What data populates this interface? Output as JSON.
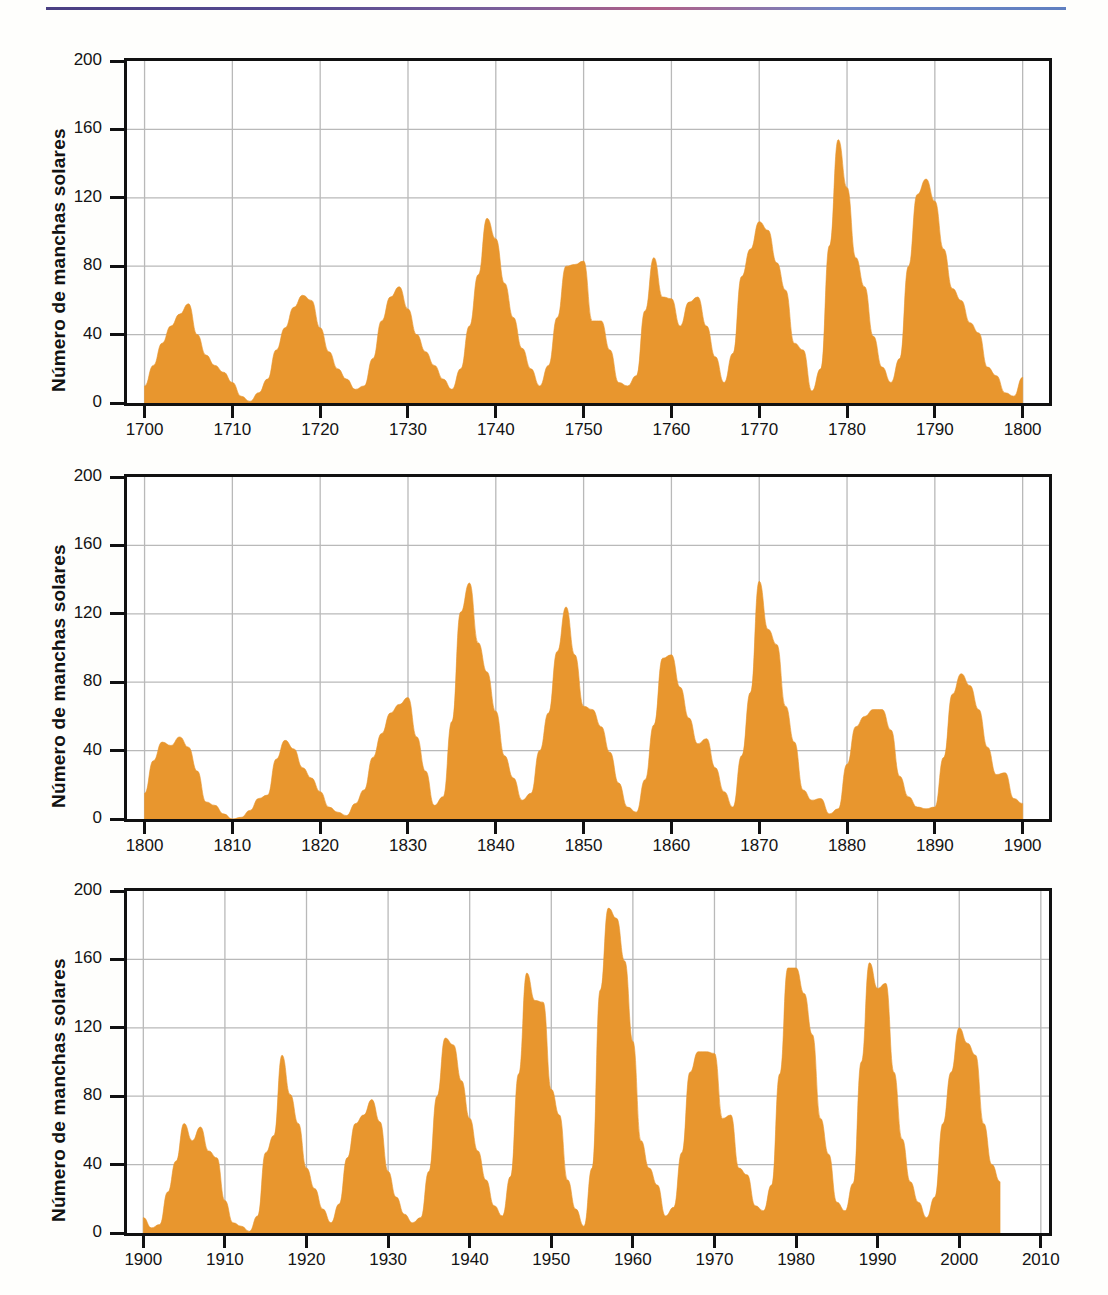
{
  "figure": {
    "ylabel": "Número de manchas solares",
    "series_color": "#e8962e",
    "grid_color": "#b9b9b9",
    "axis_color": "#111111",
    "top_rule_colors": [
      "#4a3f82",
      "#b05f86",
      "#5f7fc0"
    ]
  },
  "chart_data": [
    {
      "type": "area",
      "title": "",
      "xlabel": "",
      "ylabel": "Número de manchas solares",
      "xlim": [
        1698,
        1803
      ],
      "ylim": [
        0,
        200
      ],
      "xticks": [
        1700,
        1710,
        1720,
        1730,
        1740,
        1750,
        1760,
        1770,
        1780,
        1790,
        1800
      ],
      "yticks": [
        0,
        40,
        80,
        120,
        160,
        200
      ],
      "xtick_labels": [
        "1700",
        "1710",
        "1720",
        "1730",
        "1740",
        "1750",
        "1760",
        "1770",
        "1780",
        "1790",
        "1800"
      ],
      "ytick_labels": [
        "0",
        "40",
        "80",
        "120",
        "160",
        "200"
      ],
      "grid": true,
      "legend": "none",
      "series": [
        {
          "name": "Número de manchas solares",
          "x": [
            1700,
            1701,
            1702,
            1703,
            1704,
            1705,
            1706,
            1707,
            1708,
            1709,
            1710,
            1711,
            1712,
            1713,
            1714,
            1715,
            1716,
            1717,
            1718,
            1719,
            1720,
            1721,
            1722,
            1723,
            1724,
            1725,
            1726,
            1727,
            1728,
            1729,
            1730,
            1731,
            1732,
            1733,
            1734,
            1735,
            1736,
            1737,
            1738,
            1739,
            1740,
            1741,
            1742,
            1743,
            1744,
            1745,
            1746,
            1747,
            1748,
            1749,
            1750,
            1751,
            1752,
            1753,
            1754,
            1755,
            1756,
            1757,
            1758,
            1759,
            1760,
            1761,
            1762,
            1763,
            1764,
            1765,
            1766,
            1767,
            1768,
            1769,
            1770,
            1771,
            1772,
            1773,
            1774,
            1775,
            1776,
            1777,
            1778,
            1779,
            1780,
            1781,
            1782,
            1783,
            1784,
            1785,
            1786,
            1787,
            1788,
            1789,
            1790,
            1791,
            1792,
            1793,
            1794,
            1795,
            1796,
            1797,
            1798,
            1799,
            1800
          ],
          "values": [
            10,
            22,
            35,
            45,
            52,
            58,
            40,
            28,
            22,
            18,
            12,
            4,
            1,
            6,
            14,
            31,
            44,
            56,
            63,
            60,
            44,
            30,
            20,
            14,
            8,
            10,
            26,
            48,
            62,
            68,
            55,
            40,
            30,
            22,
            14,
            8,
            20,
            45,
            75,
            108,
            96,
            70,
            50,
            32,
            20,
            10,
            22,
            50,
            80,
            81,
            83,
            48,
            48,
            31,
            12,
            10,
            16,
            54,
            85,
            62,
            61,
            45,
            59,
            62,
            45,
            27,
            12,
            29,
            74,
            90,
            106,
            101,
            82,
            66,
            35,
            31,
            7,
            20,
            92,
            154,
            126,
            85,
            68,
            39,
            21,
            12,
            26,
            80,
            122,
            131,
            118,
            90,
            67,
            60,
            47,
            41,
            21,
            16,
            6,
            4,
            15
          ]
        }
      ]
    },
    {
      "type": "area",
      "title": "",
      "xlabel": "",
      "ylabel": "Número de manchas solares",
      "xlim": [
        1798,
        1903
      ],
      "ylim": [
        0,
        200
      ],
      "xticks": [
        1800,
        1810,
        1820,
        1830,
        1840,
        1850,
        1860,
        1870,
        1880,
        1890,
        1900
      ],
      "yticks": [
        0,
        40,
        80,
        120,
        160,
        200
      ],
      "xtick_labels": [
        "1800",
        "1810",
        "1820",
        "1830",
        "1840",
        "1850",
        "1860",
        "1870",
        "1880",
        "1890",
        "1900"
      ],
      "ytick_labels": [
        "0",
        "40",
        "80",
        "120",
        "160",
        "200"
      ],
      "grid": true,
      "legend": "none",
      "series": [
        {
          "name": "Número de manchas solares",
          "x": [
            1800,
            1801,
            1802,
            1803,
            1804,
            1805,
            1806,
            1807,
            1808,
            1809,
            1810,
            1811,
            1812,
            1813,
            1814,
            1815,
            1816,
            1817,
            1818,
            1819,
            1820,
            1821,
            1822,
            1823,
            1824,
            1825,
            1826,
            1827,
            1828,
            1829,
            1830,
            1831,
            1832,
            1833,
            1834,
            1835,
            1836,
            1837,
            1838,
            1839,
            1840,
            1841,
            1842,
            1843,
            1844,
            1845,
            1846,
            1847,
            1848,
            1849,
            1850,
            1851,
            1852,
            1853,
            1854,
            1855,
            1856,
            1857,
            1858,
            1859,
            1860,
            1861,
            1862,
            1863,
            1864,
            1865,
            1866,
            1867,
            1868,
            1869,
            1870,
            1871,
            1872,
            1873,
            1874,
            1875,
            1876,
            1877,
            1878,
            1879,
            1880,
            1881,
            1882,
            1883,
            1884,
            1885,
            1886,
            1887,
            1888,
            1889,
            1890,
            1891,
            1892,
            1893,
            1894,
            1895,
            1896,
            1897,
            1898,
            1899,
            1900
          ],
          "values": [
            15,
            34,
            45,
            43,
            48,
            42,
            28,
            10,
            8,
            3,
            0,
            1,
            5,
            12,
            14,
            35,
            46,
            41,
            30,
            24,
            16,
            7,
            4,
            2,
            9,
            17,
            36,
            50,
            62,
            67,
            71,
            48,
            28,
            8,
            13,
            57,
            121,
            138,
            103,
            86,
            63,
            37,
            24,
            11,
            15,
            40,
            62,
            98,
            124,
            96,
            66,
            64,
            54,
            39,
            21,
            7,
            4,
            23,
            55,
            94,
            96,
            77,
            59,
            44,
            47,
            30,
            16,
            7,
            37,
            74,
            139,
            111,
            102,
            66,
            45,
            17,
            11,
            12,
            3,
            6,
            32,
            54,
            60,
            64,
            64,
            52,
            25,
            13,
            7,
            6,
            7,
            36,
            73,
            85,
            78,
            64,
            42,
            26,
            27,
            12,
            9
          ]
        }
      ]
    },
    {
      "type": "area",
      "title": "",
      "xlabel": "",
      "ylabel": "Número de manchas solares",
      "xlim": [
        1898,
        2011
      ],
      "ylim": [
        0,
        200
      ],
      "xticks": [
        1900,
        1910,
        1920,
        1930,
        1940,
        1950,
        1960,
        1970,
        1980,
        1990,
        2000,
        2010
      ],
      "yticks": [
        0,
        40,
        80,
        120,
        160,
        200
      ],
      "xtick_labels": [
        "1900",
        "1910",
        "1920",
        "1930",
        "1940",
        "1950",
        "1960",
        "1970",
        "1980",
        "1990",
        "2000",
        "2010"
      ],
      "ytick_labels": [
        "0",
        "40",
        "80",
        "120",
        "160",
        "200"
      ],
      "grid": true,
      "legend": "none",
      "series": [
        {
          "name": "Número de manchas solares",
          "x": [
            1900,
            1901,
            1902,
            1903,
            1904,
            1905,
            1906,
            1907,
            1908,
            1909,
            1910,
            1911,
            1912,
            1913,
            1914,
            1915,
            1916,
            1917,
            1918,
            1919,
            1920,
            1921,
            1922,
            1923,
            1924,
            1925,
            1926,
            1927,
            1928,
            1929,
            1930,
            1931,
            1932,
            1933,
            1934,
            1935,
            1936,
            1937,
            1938,
            1939,
            1940,
            1941,
            1942,
            1943,
            1944,
            1945,
            1946,
            1947,
            1948,
            1949,
            1950,
            1951,
            1952,
            1953,
            1954,
            1955,
            1956,
            1957,
            1958,
            1959,
            1960,
            1961,
            1962,
            1963,
            1964,
            1965,
            1966,
            1967,
            1968,
            1969,
            1970,
            1971,
            1972,
            1973,
            1974,
            1975,
            1976,
            1977,
            1978,
            1979,
            1980,
            1981,
            1982,
            1983,
            1984,
            1985,
            1986,
            1987,
            1988,
            1989,
            1990,
            1991,
            1992,
            1993,
            1994,
            1995,
            1996,
            1997,
            1998,
            1999,
            2000,
            2001,
            2002,
            2003,
            2004,
            2005
          ],
          "values": [
            9,
            3,
            5,
            24,
            42,
            64,
            54,
            62,
            48,
            44,
            19,
            6,
            4,
            1,
            10,
            47,
            57,
            104,
            81,
            64,
            38,
            26,
            14,
            6,
            17,
            44,
            64,
            69,
            78,
            65,
            36,
            21,
            11,
            6,
            9,
            36,
            80,
            114,
            110,
            89,
            67,
            48,
            31,
            16,
            10,
            33,
            93,
            152,
            136,
            135,
            84,
            69,
            31,
            14,
            4,
            38,
            142,
            190,
            184,
            159,
            112,
            54,
            38,
            28,
            10,
            15,
            47,
            94,
            106,
            106,
            105,
            67,
            69,
            38,
            34,
            16,
            13,
            28,
            93,
            155,
            155,
            140,
            116,
            67,
            46,
            18,
            13,
            29,
            100,
            158,
            143,
            146,
            94,
            55,
            30,
            18,
            9,
            21,
            64,
            94,
            120,
            111,
            104,
            64,
            40,
            30
          ]
        }
      ]
    }
  ]
}
